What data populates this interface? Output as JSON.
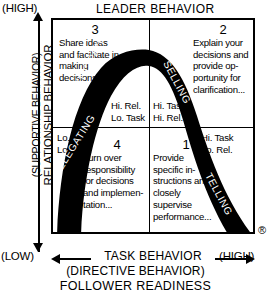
{
  "diagram": {
    "title_top": "LEADER BEHAVIOR",
    "axis_top_left_label": "(HIGH)",
    "y_axis": {
      "label_primary": "RELATIONSHIP BEHAVIOR",
      "label_secondary": "(SUPPORTIVE BEHAVIOR)",
      "top_label": "(HIGH)",
      "bottom_label": "(LOW)",
      "arrow_up": "arrow-up-icon",
      "arrow_down": "arrow-down-icon"
    },
    "x_axis": {
      "label_primary": "TASK BEHAVIOR",
      "label_secondary": "(DIRECTIVE BEHAVIOR)",
      "left_label": "(LOW)",
      "right_label": "(HIGH)",
      "arrow_left": "arrow-left-icon",
      "arrow_right": "arrow-right-icon"
    },
    "footer_label": "FOLLOWER READINESS",
    "registered_mark": "®",
    "quadrants": [
      {
        "number": "3",
        "text": "Share ideas and facilitate in making decisions...",
        "rel_task": "Hi. Rel.\nLo. Task",
        "rel_line1": "Hi. Rel.",
        "rel_line2": "Lo. Task",
        "style_name": "PARTICIPATING"
      },
      {
        "number": "2",
        "text": "Explain your decisions and provide op-portunity for clarification...",
        "rel_line1": "Hi. Task",
        "rel_line2": "Hi. Rel.",
        "style_name": "SELLING"
      },
      {
        "number": "4",
        "text": "Turn over responsibility for decisions and implemen-tation...",
        "rel_line1": "Lo. Rel.",
        "rel_line2": "Lo. Task",
        "style_name": "DELEGATING"
      },
      {
        "number": "1",
        "text": "Provide specific in-structions and closely supervise performance...",
        "rel_line1": "Hi. Task",
        "rel_line2": "Lo. Rel.",
        "style_name": "TELLING"
      }
    ],
    "curve_labels": {
      "participating": "PARTICIPATING",
      "selling": "SELLING",
      "delegating": "DELEGATING",
      "telling": "TELLING"
    },
    "colors": {
      "curve": "#000000",
      "curve_text": "#ffffff",
      "border": "#000000",
      "background": "#ffffff"
    }
  }
}
